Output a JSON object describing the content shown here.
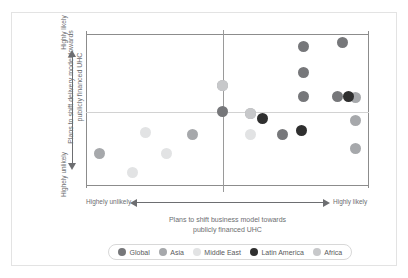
{
  "chart_data": {
    "type": "scatter",
    "title": "",
    "xlabel": "Plans to shift business model towards publicly financed UHC",
    "ylabel": "Plans to shift delivery model towards publicly financed UHC",
    "x_axis": {
      "low_label": "Highely unlikely",
      "high_label": "Highly likely",
      "xlim": [
        0,
        100
      ],
      "divider_at": 48.4
    },
    "y_axis": {
      "low_label": "Highely unlikely",
      "high_label": "Highly likely",
      "ylim": [
        0,
        100
      ],
      "divider_at": 48.7
    },
    "grid": false,
    "legend_position": "bottom",
    "series": [
      {
        "name": "Global",
        "color": "#76777a",
        "points": [
          {
            "x": 48.4,
            "y": 48.7
          },
          {
            "x": 69.6,
            "y": 33.6
          },
          {
            "x": 77.0,
            "y": 92.1
          },
          {
            "x": 77.0,
            "y": 75.0
          },
          {
            "x": 77.0,
            "y": 58.6
          },
          {
            "x": 90.5,
            "y": 94.7
          },
          {
            "x": 89.0,
            "y": 58.6
          }
        ]
      },
      {
        "name": "Asia",
        "color": "#a6a8ab",
        "points": [
          {
            "x": 4.6,
            "y": 21.1
          },
          {
            "x": 37.5,
            "y": 33.6
          },
          {
            "x": 48.4,
            "y": 65.8
          },
          {
            "x": 58.0,
            "y": 48.0
          },
          {
            "x": 95.4,
            "y": 57.9
          },
          {
            "x": 95.4,
            "y": 42.8
          },
          {
            "x": 95.4,
            "y": 25.0
          }
        ]
      },
      {
        "name": "Middle East",
        "color": "#e2e3e4",
        "points": [
          {
            "x": 21.2,
            "y": 34.9
          },
          {
            "x": 28.3,
            "y": 21.7
          },
          {
            "x": 16.3,
            "y": 9.2
          },
          {
            "x": 58.0,
            "y": 33.6
          }
        ]
      },
      {
        "name": "Latin America",
        "color": "#2f2f2f",
        "points": [
          {
            "x": 62.2,
            "y": 44.7
          },
          {
            "x": 76.0,
            "y": 36.8
          },
          {
            "x": 92.6,
            "y": 58.6
          }
        ]
      },
      {
        "name": "Africa",
        "color": "#c7c8ca",
        "points": [
          {
            "x": 48.4,
            "y": 65.8
          },
          {
            "x": 58.0,
            "y": 48.0
          }
        ]
      }
    ]
  },
  "legend": {
    "items": [
      {
        "label": "Global",
        "color": "#76777a"
      },
      {
        "label": "Asia",
        "color": "#a6a8ab"
      },
      {
        "label": "Middle East",
        "color": "#e2e3e4"
      },
      {
        "label": "Latin America",
        "color": "#2f2f2f"
      },
      {
        "label": "Africa",
        "color": "#c7c8ca"
      }
    ]
  },
  "axes": {
    "y_title_line1": "Plans to shift delivery model towards",
    "y_title_line2": "publicly financed UHC",
    "y_high": "Highly likely",
    "y_low": "Highely unlikely",
    "x_title_line1": "Plans to shift business model towards",
    "x_title_line2": "publicly financed UHC",
    "x_high": "Highly likely",
    "x_low": "Highely unlikely"
  }
}
